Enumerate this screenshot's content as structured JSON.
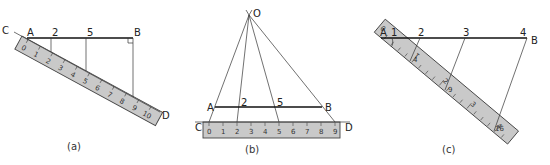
{
  "colors": {
    "background": "#ffffff",
    "line": "#111111",
    "ruler_fill": "#c9c9c9",
    "ruler_edge": "#444444"
  },
  "panels": [
    {
      "caption": "(a)",
      "points": {
        "C": "C",
        "A": "A",
        "B": "B",
        "D": "D"
      },
      "division_labels": [
        "2",
        "5"
      ],
      "ruler_numbers": [
        "0",
        "1",
        "2",
        "3",
        "4",
        "5",
        "6",
        "7",
        "8",
        "9",
        "10"
      ],
      "right_angle_at": "B"
    },
    {
      "caption": "(b)",
      "points": {
        "O": "O",
        "A": "A",
        "B": "B",
        "C": "C",
        "D": "D"
      },
      "division_labels": [
        "2",
        "5"
      ],
      "ruler_numbers": [
        "0",
        "1",
        "2",
        "3",
        "4",
        "5",
        "6",
        "7",
        "8",
        "9"
      ]
    },
    {
      "caption": "(c)",
      "points": {
        "A": "A",
        "B": "B"
      },
      "division_labels": [
        "1",
        "2",
        "3",
        "4"
      ],
      "ruler_numbers": [
        "0",
        "1",
        "2",
        "3",
        "4"
      ],
      "ruler_marks": [
        "4",
        "9",
        "16"
      ]
    }
  ]
}
